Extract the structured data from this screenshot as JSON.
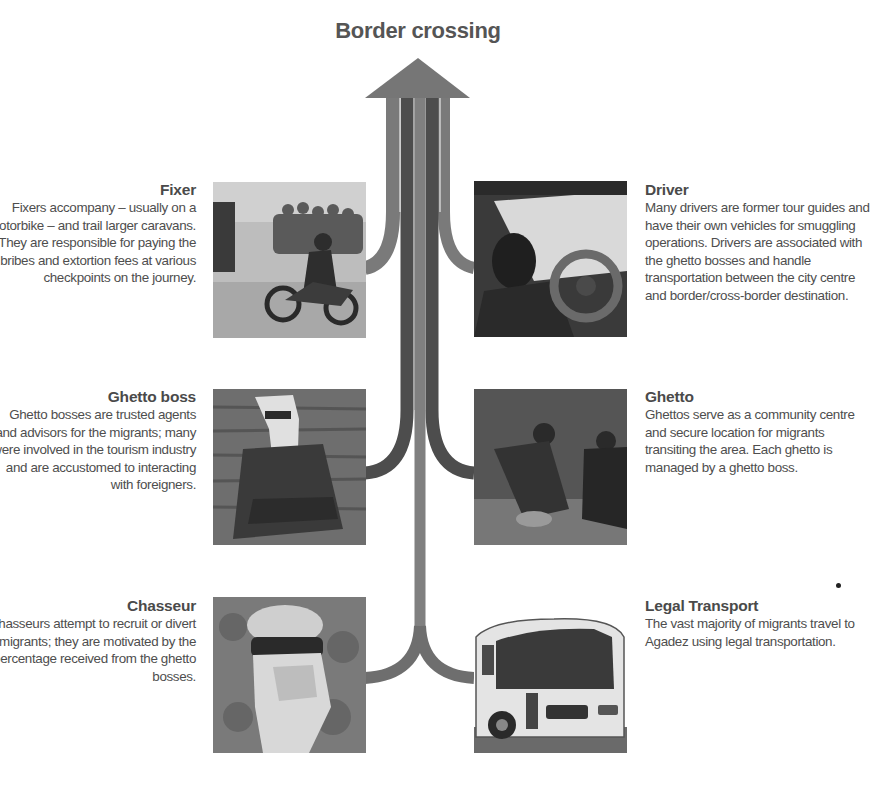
{
  "title": "Border crossing",
  "arrow": {
    "label": "arrow-to-border-crossing",
    "colors": {
      "outer": "#7a7a7a",
      "dark": "#4a4a4a",
      "center": "#808080",
      "head": "#767676"
    }
  },
  "roles": {
    "fixer": {
      "title": "Fixer",
      "description": "Fixers accompany – usually on a motorbike – and trail larger caravans. They are responsible for paying the bribes and extortion fees at various checkpoints on the journey.",
      "photo": "motorbike-rider-with-caravan-photo",
      "side": "left"
    },
    "driver": {
      "title": "Driver",
      "description": "Many drivers are former tour guides and have their own vehicles for smuggling operations. Drivers are associated with the ghetto bosses and handle transportation between the city centre and border/cross-border destination.",
      "photo": "driver-at-steering-wheel-photo",
      "side": "right"
    },
    "ghetto_boss": {
      "title": "Ghetto boss",
      "description": "Ghetto bosses are trusted agents and advisors for the migrants; many were involved in the tourism industry and are accustomed to interacting with foreigners.",
      "photo": "seated-man-in-turban-photo",
      "side": "left"
    },
    "ghetto": {
      "title": "Ghetto",
      "description": "Ghettos serve as a community centre and secure location for migrants transiting the area. Each ghetto is managed by a ghetto boss.",
      "photo": "men-in-ghetto-compound-photo",
      "side": "right"
    },
    "chasseur": {
      "title": "Chasseur",
      "description": "Chasseurs attempt to recruit or divert migrants; they are motivated by the percentage received from the ghetto bosses.",
      "photo": "face-covered-man-photo",
      "side": "left"
    },
    "legal_transport": {
      "title": "Legal Transport",
      "description": "The vast majority of migrants travel to Agadez using legal transportation.",
      "photo": "passenger-bus-photo",
      "side": "right"
    }
  }
}
